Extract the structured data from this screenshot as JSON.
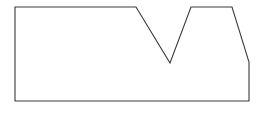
{
  "canvas": {
    "width": 265,
    "height": 113,
    "background_color": "#ffffff"
  },
  "figure": {
    "name": "notched-polygon",
    "stroke_color": "#3a3a3a",
    "fill_color": "#ffffff",
    "stroke_width": 1.1,
    "closed": true,
    "vertex_count": 8,
    "points": "15,7 136,7 170,63 191,7 232,7 249,62 249,101 15,101",
    "vertices": [
      {
        "label": "top-left-corner",
        "x": 15,
        "y": 7
      },
      {
        "label": "notch-left-shoulder",
        "x": 136,
        "y": 7
      },
      {
        "label": "notch-bottom-apex",
        "x": 170,
        "y": 63
      },
      {
        "label": "notch-right-shoulder",
        "x": 191,
        "y": 7
      },
      {
        "label": "plateau-right-end",
        "x": 232,
        "y": 7
      },
      {
        "label": "right-bevel-bottom",
        "x": 249,
        "y": 62
      },
      {
        "label": "bottom-right-corner",
        "x": 249,
        "y": 101
      },
      {
        "label": "bottom-left-corner",
        "x": 15,
        "y": 101
      }
    ],
    "edges": [
      {
        "name": "top-left-edge",
        "from": "top-left-corner",
        "to": "notch-left-shoulder",
        "orientation": "horizontal"
      },
      {
        "name": "notch-left-slope",
        "from": "notch-left-shoulder",
        "to": "notch-bottom-apex",
        "orientation": "diagonal-down-right"
      },
      {
        "name": "notch-right-slope",
        "from": "notch-bottom-apex",
        "to": "notch-right-shoulder",
        "orientation": "diagonal-up-right"
      },
      {
        "name": "top-right-plateau",
        "from": "notch-right-shoulder",
        "to": "plateau-right-end",
        "orientation": "horizontal"
      },
      {
        "name": "right-bevel-edge",
        "from": "plateau-right-end",
        "to": "right-bevel-bottom",
        "orientation": "diagonal-down-right"
      },
      {
        "name": "right-vertical-edge",
        "from": "right-bevel-bottom",
        "to": "bottom-right-corner",
        "orientation": "vertical"
      },
      {
        "name": "bottom-edge",
        "from": "bottom-right-corner",
        "to": "bottom-left-corner",
        "orientation": "horizontal"
      },
      {
        "name": "left-vertical-edge",
        "from": "bottom-left-corner",
        "to": "top-left-corner",
        "orientation": "vertical"
      }
    ]
  }
}
